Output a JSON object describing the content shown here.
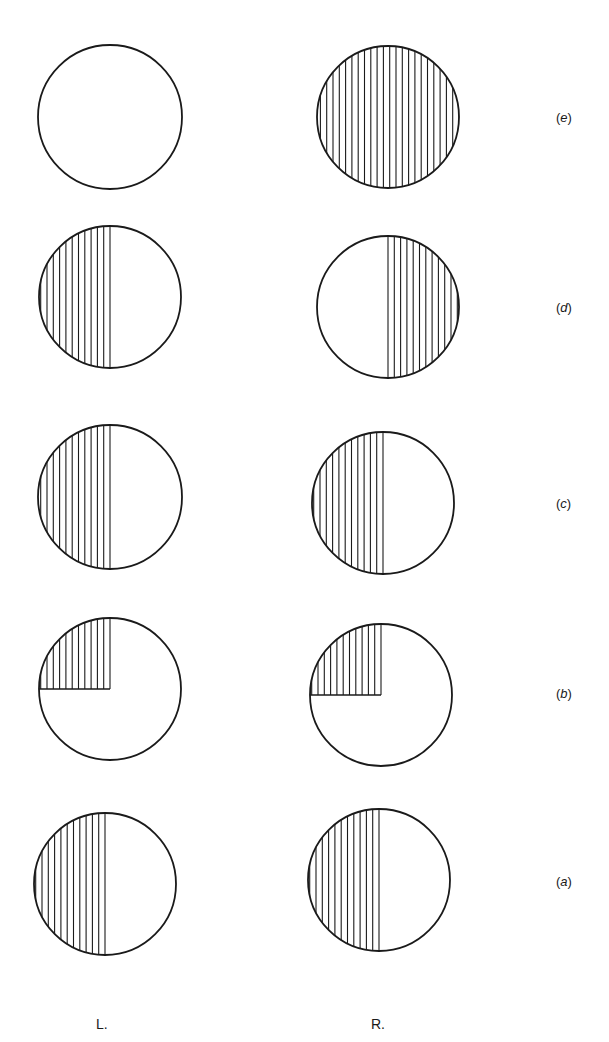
{
  "figure": {
    "stroke_color": "#1a1a1a",
    "background": "#ffffff",
    "columns": [
      {
        "key": "L",
        "label": "L."
      },
      {
        "key": "R",
        "label": "R."
      }
    ],
    "rows": [
      {
        "id": "e",
        "label": "(e)",
        "L": {
          "cx": 110,
          "cy": 117,
          "r": 72,
          "shade": "none"
        },
        "R": {
          "cx": 388,
          "cy": 117,
          "r": 71,
          "shade": "full"
        }
      },
      {
        "id": "d",
        "label": "(d)",
        "L": {
          "cx": 110,
          "cy": 297,
          "r": 71,
          "shade": "left-half"
        },
        "R": {
          "cx": 388,
          "cy": 307,
          "r": 71,
          "shade": "right-half"
        }
      },
      {
        "id": "c",
        "label": "(c)",
        "L": {
          "cx": 110,
          "cy": 497,
          "r": 72,
          "shade": "left-half"
        },
        "R": {
          "cx": 383,
          "cy": 503,
          "r": 71,
          "shade": "left-half"
        }
      },
      {
        "id": "b",
        "label": "(b)",
        "L": {
          "cx": 110,
          "cy": 689,
          "r": 71,
          "shade": "upper-left-quadrant"
        },
        "R": {
          "cx": 381,
          "cy": 695,
          "r": 71,
          "shade": "upper-left-quadrant"
        }
      },
      {
        "id": "a",
        "label": "(a)",
        "L": {
          "cx": 105,
          "cy": 884,
          "r": 71,
          "shade": "left-half"
        },
        "R": {
          "cx": 379,
          "cy": 880,
          "r": 71,
          "shade": "left-half"
        }
      }
    ],
    "hatch": {
      "style": "vertical-lines",
      "spacing_px": 6.3
    }
  },
  "labels": {
    "row_e": "e",
    "row_d": "d",
    "row_c": "c",
    "row_b": "b",
    "row_a": "a",
    "col_left": "L.",
    "col_right": "R."
  }
}
